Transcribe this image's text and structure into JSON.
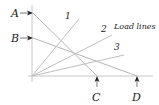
{
  "diagram": {
    "title": "Load lines",
    "labels": {
      "A": "A",
      "B": "B",
      "C": "C",
      "D": "D",
      "line1": "1",
      "line2": "2",
      "line3": "3",
      "load_lines": "Load lines"
    },
    "colors": {
      "axis": "#c8c8c8",
      "line": "#b8b8b8",
      "text": "#222222"
    }
  }
}
